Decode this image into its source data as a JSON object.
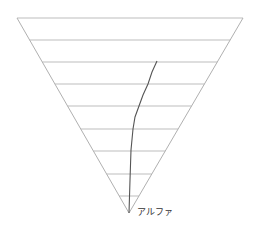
{
  "diagram": {
    "type": "inverted-triangle-funnel",
    "tip_label": "アルファ",
    "colors": {
      "background": "#ffffff",
      "outline": "#b0b0b0",
      "gridline": "#bdbdbd",
      "trace": "#555555",
      "label": "#333333"
    },
    "triangle": {
      "top_left": [
        17,
        18
      ],
      "top_right": [
        243,
        18
      ],
      "tip": [
        129,
        213
      ]
    },
    "horizontal_lines_y": [
      18,
      40,
      62,
      84,
      106,
      129,
      151,
      174,
      196
    ],
    "trace_path": [
      [
        157,
        61
      ],
      [
        152,
        72
      ],
      [
        148,
        84
      ],
      [
        143,
        95
      ],
      [
        139,
        106
      ],
      [
        135,
        117
      ],
      [
        133,
        129
      ],
      [
        131,
        150
      ],
      [
        130,
        180
      ],
      [
        129,
        213
      ]
    ]
  }
}
